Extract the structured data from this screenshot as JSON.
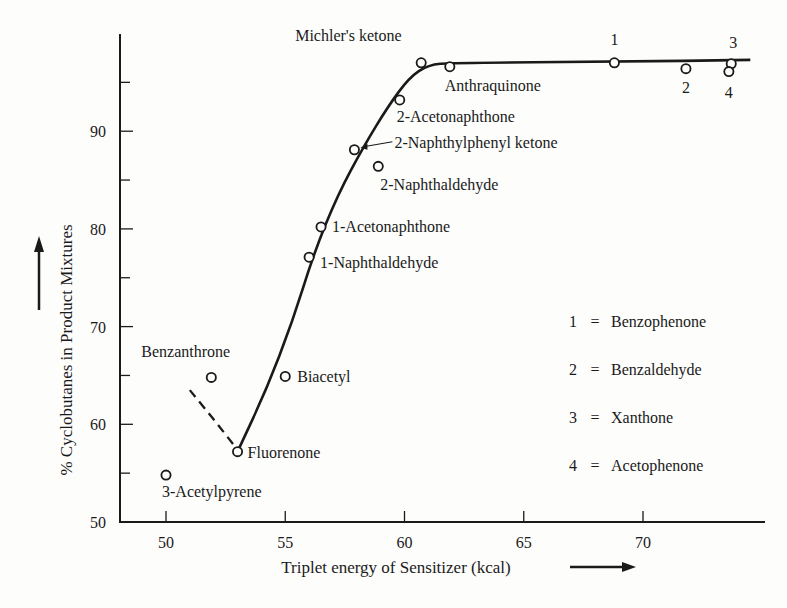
{
  "chart_data": {
    "type": "scatter",
    "title": "",
    "xlabel": "Triplet energy of Sensitizer (kcal)",
    "ylabel": "% Cyclobutanes in Product Mixtures",
    "xlim": [
      48,
      74.5
    ],
    "ylim": [
      50,
      100
    ],
    "xticks": [
      50,
      55,
      60,
      65,
      70
    ],
    "yticks_labeled": [
      50,
      60,
      70,
      80,
      90
    ],
    "yticks_minor": [
      55,
      65,
      75,
      85,
      95
    ],
    "grid": false,
    "points": [
      {
        "name": "3-Acetylpyrene",
        "x": 50.0,
        "y": 54.8,
        "label_pos": "below"
      },
      {
        "name": "Benzanthrone",
        "x": 51.9,
        "y": 64.8,
        "label_pos": "above"
      },
      {
        "name": "Fluorenone",
        "x": 53.0,
        "y": 57.2,
        "label_pos": "right"
      },
      {
        "name": "Biacetyl",
        "x": 55.0,
        "y": 64.9,
        "label_pos": "right"
      },
      {
        "name": "1-Naphthaldehyde",
        "x": 56.0,
        "y": 77.1,
        "label_pos": "right"
      },
      {
        "name": "1-Acetonaphthone",
        "x": 56.5,
        "y": 80.2,
        "label_pos": "right"
      },
      {
        "name": "2-Naphthylphenyl ketone",
        "x": 57.9,
        "y": 88.1,
        "label_pos": "right-arrow"
      },
      {
        "name": "2-Naphthaldehyde",
        "x": 58.9,
        "y": 86.4,
        "label_pos": "below"
      },
      {
        "name": "2-Acetonaphthone",
        "x": 59.8,
        "y": 93.2,
        "label_pos": "below-right"
      },
      {
        "name": "Michler's ketone",
        "x": 60.7,
        "y": 97.0,
        "label_pos": "above-left"
      },
      {
        "name": "Anthraquinone",
        "x": 61.9,
        "y": 96.6,
        "label_pos": "below"
      },
      {
        "name": "1",
        "x": 68.8,
        "y": 97.0,
        "label_pos": "above"
      },
      {
        "name": "2",
        "x": 71.8,
        "y": 96.4,
        "label_pos": "below"
      },
      {
        "name": "3",
        "x": 73.7,
        "y": 96.9,
        "label_pos": "above"
      },
      {
        "name": "4",
        "x": 73.6,
        "y": 96.1,
        "label_pos": "below"
      }
    ],
    "curve_solid": [
      [
        53.0,
        57.2
      ],
      [
        54.2,
        63.5
      ],
      [
        55.3,
        70.5
      ],
      [
        56.2,
        77.5
      ],
      [
        57.2,
        83.5
      ],
      [
        58.3,
        88.5
      ],
      [
        59.3,
        92.5
      ],
      [
        60.2,
        95.5
      ],
      [
        61.0,
        96.8
      ],
      [
        62.0,
        97.0
      ],
      [
        68.8,
        97.1
      ],
      [
        74.5,
        97.3
      ]
    ],
    "curve_dashed": [
      [
        51.0,
        63.5
      ],
      [
        52.0,
        60.5
      ],
      [
        53.0,
        57.4
      ]
    ],
    "legend": {
      "position": "right-middle",
      "entries": [
        {
          "key": "1",
          "value": "Benzophenone"
        },
        {
          "key": "2",
          "value": "Benzaldehyde"
        },
        {
          "key": "3",
          "value": "Xanthone"
        },
        {
          "key": "4",
          "value": "Acetophenone"
        }
      ]
    }
  },
  "legend_eq": "=",
  "colors": {
    "ink": "#1a1a1a",
    "paper": "#fdfdfc"
  }
}
